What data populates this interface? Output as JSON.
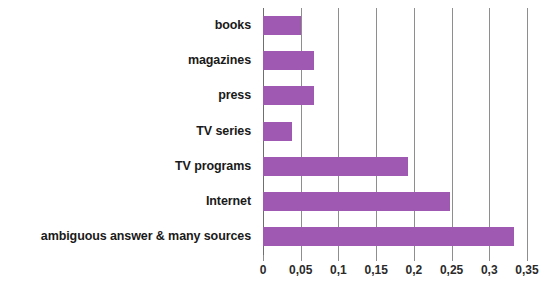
{
  "chart_data": {
    "type": "bar",
    "orientation": "horizontal",
    "title": "",
    "subtitle": "",
    "xlabel": "",
    "ylabel": "",
    "categories": [
      "books",
      "magazines",
      "press",
      "TV series",
      "TV programs",
      "Internet",
      "ambiguous answer & many sources"
    ],
    "values": [
      0.05,
      0.068,
      0.068,
      0.038,
      0.192,
      0.248,
      0.333
    ],
    "xlim": [
      0,
      0.35
    ],
    "xticks": [
      0,
      0.05,
      0.1,
      0.15,
      0.2,
      0.25,
      0.3,
      0.35
    ],
    "xtick_labels": [
      "0",
      "0,05",
      "0,1",
      "0,15",
      "0,2",
      "0,25",
      "0,3",
      "0,35"
    ],
    "decimal_separator": ",",
    "grid": "vertical",
    "legend": null,
    "bar_color": "#a059b3",
    "grid_color": "#8e8e8e",
    "axis_color": "#6f6f6f",
    "label_color": "#1a1a1a",
    "background": "#ffffff"
  }
}
